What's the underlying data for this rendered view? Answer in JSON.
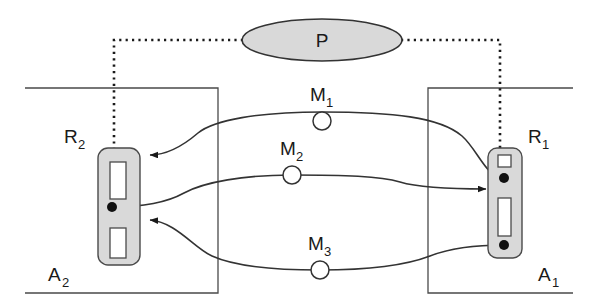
{
  "figure": {
    "title": "",
    "width": 595,
    "height": 305,
    "background": "#ffffff",
    "stroke_color": "#333333",
    "fill_gray": "#d9d9d9",
    "white": "#ffffff"
  },
  "nodes": {
    "process": {
      "label": "P",
      "name": "process-ellipse",
      "shape": "ellipse",
      "cx": 322,
      "cy": 40,
      "rx": 80,
      "ry": 21,
      "fill": "#d9d9d9"
    },
    "agents": [
      {
        "id": "A2",
        "label": "A",
        "subscript": "2",
        "name": "agent-a2-boundary",
        "x": 25,
        "y": 88,
        "width": 193,
        "height": 205
      },
      {
        "id": "A1",
        "label": "A",
        "subscript": "1",
        "name": "agent-a1-boundary",
        "x": 428,
        "y": 88,
        "width": 145,
        "height": 205
      }
    ],
    "resources": [
      {
        "id": "R2",
        "label": "R",
        "subscript": "2",
        "name": "resource-r2",
        "x": 98,
        "y": 148,
        "width": 42,
        "height": 117,
        "fill": "#d9d9d9",
        "label_x": 72,
        "label_y": 143
      },
      {
        "id": "R1",
        "label": "R",
        "subscript": "1",
        "name": "resource-r1",
        "x": 488,
        "y": 148,
        "width": 34,
        "height": 110,
        "fill": "#d9d9d9",
        "label_x": 530,
        "label_y": 143
      }
    ],
    "messages": [
      {
        "id": "M1",
        "label": "M",
        "subscript": "1",
        "name": "message-m1",
        "cx": 322,
        "cy": 121,
        "r": 9,
        "label_x": 314,
        "label_y": 100
      },
      {
        "id": "M2",
        "label": "M",
        "subscript": "2",
        "name": "message-m2",
        "cx": 292,
        "cy": 175,
        "r": 9,
        "label_x": 284,
        "label_y": 154
      },
      {
        "id": "M3",
        "label": "M",
        "subscript": "3",
        "name": "message-m3",
        "cx": 320,
        "cy": 265,
        "r": 9,
        "label_x": 312,
        "label_y": 244
      }
    ]
  },
  "connections": {
    "dotted_link": {
      "name": "process-dotted-link",
      "style": "dotted",
      "from": "R2",
      "to": "R1",
      "via": "P"
    },
    "message_flows": [
      {
        "name": "flow-m1",
        "from": "R1",
        "to": "R2",
        "via": "M1",
        "arrow_at": "R2"
      },
      {
        "name": "flow-m2",
        "from": "R2",
        "to": "R1",
        "via": "M2",
        "arrow_at": "R1"
      },
      {
        "name": "flow-m3",
        "from": "R1",
        "to": "R2",
        "via": "M3",
        "arrow_at": "R2"
      }
    ]
  }
}
